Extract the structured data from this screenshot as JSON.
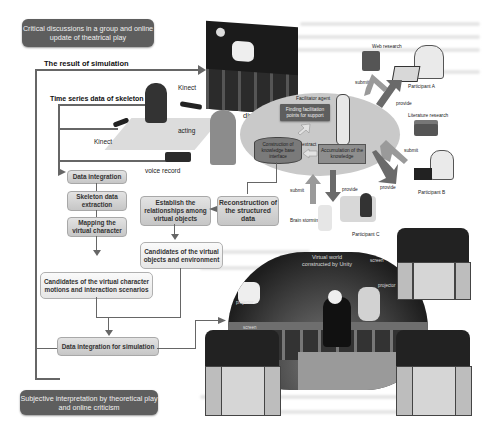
{
  "title_boxes": {
    "top": "Critical discussions in a group and online update of theatrical play",
    "bottom": "Subjective interpretation by theoretical play and online criticism"
  },
  "labels": {
    "result_of_simulation": "The result of simulation",
    "time_series": "Time series data of skeleton",
    "kinect_top": "Kinect",
    "kinect_bottom": "Kinect",
    "acting": "acting",
    "voice_record": "voice record",
    "discussing": "discussing",
    "facilitator_agent": "Facilitator agent",
    "extract": "extract",
    "web_research": "Web research",
    "literature_research": "Literature research",
    "participant_a": "Participant A",
    "participant_b": "Participant B",
    "participant_c": "Participant C",
    "brain_storming": "Brain storming",
    "submit_a": "submit",
    "provide_a": "provide",
    "submit_b": "submit",
    "provide_b": "provide",
    "submit_c": "submit",
    "provide_c": "provide",
    "virtual_world": "Virtual world constructed by Unity",
    "projector_tl": "projector",
    "screen_tl": "screen",
    "projector_tr": "projector",
    "screen_tr": "screen"
  },
  "ellipse_boxes": {
    "finding_points": "Finding facilitation points for support",
    "knowledge_base": "Construction of knowledge base interface",
    "accumulation": "Accumulation of the knowledge"
  },
  "flow": {
    "data_integration": "Data integration",
    "skeleton_extraction": "Skeleton data extraction",
    "mapping_character": "Mapping the virtual character",
    "establish_relationships": "Establish the relationships among virtual objects",
    "reconstruction": "Reconstruction of the structured data",
    "candidates_objects": "Candidates of the virtual objects and environment",
    "candidates_motions": "Candidates of the virtual character motions and interaction scenarios",
    "data_integration_sim": "Data integration for simulation"
  },
  "colors": {
    "dark_box": "#5e5e5e",
    "ellipse": "#c9c9c9",
    "arrow_dark": "#6a6a6a",
    "arrow_light": "#a6a6a6"
  }
}
